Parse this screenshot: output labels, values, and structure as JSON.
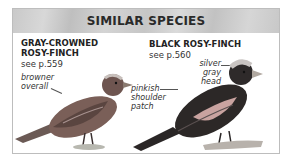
{
  "header": {
    "title": "SIMILAR SPECIES"
  },
  "species": [
    {
      "name_line1": "GRAY-CROWNED",
      "name_line2": "ROSY-FINCH",
      "ref": "see p.559",
      "notes": [
        {
          "line1": "browner",
          "line2": "overall"
        }
      ]
    },
    {
      "name_line1": "BLACK ROSY-FINCH",
      "ref": "see p.560",
      "notes": [
        {
          "line1": "silver gray",
          "line2": "head"
        },
        {
          "line1": "pinkish",
          "line2": "shoulder",
          "line3": "patch"
        }
      ]
    }
  ]
}
